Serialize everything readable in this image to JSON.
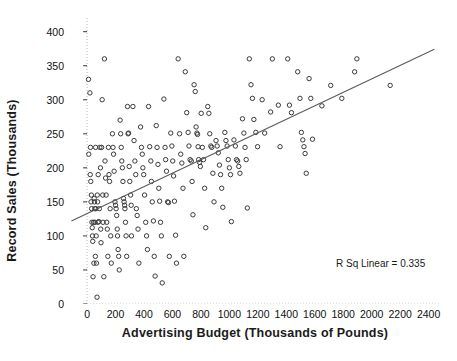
{
  "chart_data": {
    "type": "scatter",
    "title": "",
    "xlabel": "Advertising Budget (Thousands of Pounds)",
    "ylabel": "Record Sales (Thousands)",
    "xlim": [
      -120,
      2480
    ],
    "ylim": [
      0,
      420
    ],
    "xticks": [
      0,
      200,
      400,
      600,
      800,
      1000,
      1200,
      1400,
      1600,
      1800,
      2000,
      2200,
      2400
    ],
    "yticks": [
      0,
      50,
      100,
      150,
      200,
      250,
      300,
      350,
      400
    ],
    "xtick_labels": [
      "0",
      "200",
      "400",
      "600",
      "800",
      "1000",
      "1200",
      "1400",
      "1600",
      "1800",
      "2000",
      "2200",
      "2400"
    ],
    "ytick_labels": [
      "0",
      "50",
      "100",
      "150",
      "200",
      "250",
      "300",
      "350",
      "400"
    ],
    "grid": false,
    "legend": "none",
    "annotations": [
      {
        "text": "R Sq Linear = 0.335",
        "x": 2000,
        "y": 55
      }
    ],
    "marker": {
      "shape": "open-circle",
      "size": 4.4,
      "edge_color": "#3a3a3a",
      "face_color": "none"
    },
    "fit_line": {
      "type": "linear",
      "r_squared": 0.335,
      "color": "#5a5a5a",
      "x_start": -110,
      "y_start": 122,
      "x_end": 2440,
      "y_end": 374
    },
    "axis_line_color": "#b8b8b8",
    "axis_line_style": "dotted",
    "points": [
      [
        10,
        330
      ],
      [
        12,
        220
      ],
      [
        20,
        310
      ],
      [
        22,
        190
      ],
      [
        24,
        230
      ],
      [
        26,
        180
      ],
      [
        28,
        150
      ],
      [
        30,
        160
      ],
      [
        32,
        140
      ],
      [
        34,
        120
      ],
      [
        36,
        112
      ],
      [
        38,
        100
      ],
      [
        40,
        92
      ],
      [
        42,
        40
      ],
      [
        46,
        120
      ],
      [
        48,
        60
      ],
      [
        50,
        155
      ],
      [
        52,
        150
      ],
      [
        54,
        140
      ],
      [
        56,
        120
      ],
      [
        58,
        70
      ],
      [
        60,
        230
      ],
      [
        62,
        140
      ],
      [
        64,
        100
      ],
      [
        66,
        60
      ],
      [
        70,
        10
      ],
      [
        72,
        160
      ],
      [
        74,
        150
      ],
      [
        76,
        120
      ],
      [
        78,
        190
      ],
      [
        82,
        121
      ],
      [
        86,
        140
      ],
      [
        90,
        230
      ],
      [
        94,
        200
      ],
      [
        96,
        110
      ],
      [
        98,
        90
      ],
      [
        102,
        230
      ],
      [
        106,
        300
      ],
      [
        110,
        160
      ],
      [
        112,
        120
      ],
      [
        118,
        40
      ],
      [
        122,
        360
      ],
      [
        126,
        210
      ],
      [
        130,
        185
      ],
      [
        134,
        160
      ],
      [
        138,
        120
      ],
      [
        142,
        110
      ],
      [
        146,
        70
      ],
      [
        150,
        230
      ],
      [
        154,
        190
      ],
      [
        158,
        180
      ],
      [
        162,
        140
      ],
      [
        166,
        100
      ],
      [
        170,
        60
      ],
      [
        178,
        250
      ],
      [
        182,
        230
      ],
      [
        186,
        220
      ],
      [
        190,
        195
      ],
      [
        196,
        150
      ],
      [
        200,
        145
      ],
      [
        204,
        140
      ],
      [
        208,
        130
      ],
      [
        212,
        110
      ],
      [
        214,
        100
      ],
      [
        218,
        80
      ],
      [
        222,
        70
      ],
      [
        226,
        50
      ],
      [
        232,
        270
      ],
      [
        236,
        250
      ],
      [
        240,
        230
      ],
      [
        244,
        210
      ],
      [
        248,
        200
      ],
      [
        252,
        180
      ],
      [
        256,
        155
      ],
      [
        260,
        150
      ],
      [
        264,
        145
      ],
      [
        266,
        140
      ],
      [
        270,
        120
      ],
      [
        274,
        100
      ],
      [
        278,
        70
      ],
      [
        284,
        290
      ],
      [
        288,
        250
      ],
      [
        292,
        251
      ],
      [
        296,
        202
      ],
      [
        300,
        180
      ],
      [
        306,
        160
      ],
      [
        310,
        145
      ],
      [
        312,
        100
      ],
      [
        322,
        290
      ],
      [
        330,
        240
      ],
      [
        336,
        210
      ],
      [
        342,
        190
      ],
      [
        346,
        140
      ],
      [
        352,
        130
      ],
      [
        358,
        110
      ],
      [
        364,
        60
      ],
      [
        376,
        260
      ],
      [
        382,
        230
      ],
      [
        388,
        220
      ],
      [
        392,
        200
      ],
      [
        398,
        190
      ],
      [
        404,
        160
      ],
      [
        412,
        120
      ],
      [
        418,
        100
      ],
      [
        424,
        80
      ],
      [
        432,
        290
      ],
      [
        440,
        231
      ],
      [
        448,
        210
      ],
      [
        452,
        180
      ],
      [
        458,
        150
      ],
      [
        466,
        122
      ],
      [
        472,
        70
      ],
      [
        478,
        41
      ],
      [
        486,
        262
      ],
      [
        492,
        230
      ],
      [
        498,
        205
      ],
      [
        504,
        170
      ],
      [
        510,
        151
      ],
      [
        516,
        120
      ],
      [
        522,
        100
      ],
      [
        528,
        31
      ],
      [
        540,
        301
      ],
      [
        548,
        230
      ],
      [
        552,
        212
      ],
      [
        558,
        195
      ],
      [
        566,
        150
      ],
      [
        572,
        149
      ],
      [
        578,
        70
      ],
      [
        588,
        251
      ],
      [
        596,
        232
      ],
      [
        602,
        210
      ],
      [
        608,
        188
      ],
      [
        614,
        151
      ],
      [
        622,
        101
      ],
      [
        628,
        60
      ],
      [
        640,
        360
      ],
      [
        650,
        250
      ],
      [
        658,
        220
      ],
      [
        666,
        207
      ],
      [
        674,
        170
      ],
      [
        680,
        70
      ],
      [
        690,
        341
      ],
      [
        700,
        281
      ],
      [
        710,
        252
      ],
      [
        716,
        232
      ],
      [
        724,
        212
      ],
      [
        732,
        210
      ],
      [
        738,
        180
      ],
      [
        744,
        131
      ],
      [
        752,
        322
      ],
      [
        760,
        312
      ],
      [
        766,
        260
      ],
      [
        772,
        251
      ],
      [
        776,
        249
      ],
      [
        780,
        231
      ],
      [
        784,
        212
      ],
      [
        790,
        208
      ],
      [
        796,
        202
      ],
      [
        802,
        280
      ],
      [
        810,
        230
      ],
      [
        818,
        212
      ],
      [
        826,
        170
      ],
      [
        834,
        112
      ],
      [
        848,
        290
      ],
      [
        856,
        280
      ],
      [
        862,
        250
      ],
      [
        870,
        232
      ],
      [
        876,
        230
      ],
      [
        884,
        192
      ],
      [
        892,
        150
      ],
      [
        906,
        240
      ],
      [
        914,
        232
      ],
      [
        922,
        222
      ],
      [
        930,
        204
      ],
      [
        938,
        190
      ],
      [
        946,
        170
      ],
      [
        954,
        142
      ],
      [
        968,
        252
      ],
      [
        976,
        240
      ],
      [
        984,
        232
      ],
      [
        992,
        212
      ],
      [
        1000,
        200
      ],
      [
        1008,
        190
      ],
      [
        1014,
        121
      ],
      [
        1032,
        241
      ],
      [
        1042,
        232
      ],
      [
        1050,
        212
      ],
      [
        1058,
        210
      ],
      [
        1066,
        202
      ],
      [
        1074,
        192
      ],
      [
        1092,
        272
      ],
      [
        1102,
        251
      ],
      [
        1110,
        230
      ],
      [
        1118,
        212
      ],
      [
        1126,
        141
      ],
      [
        1140,
        360
      ],
      [
        1152,
        322
      ],
      [
        1162,
        302
      ],
      [
        1172,
        271
      ],
      [
        1186,
        252
      ],
      [
        1198,
        231
      ],
      [
        1230,
        300
      ],
      [
        1248,
        251
      ],
      [
        1290,
        282
      ],
      [
        1302,
        360
      ],
      [
        1344,
        292
      ],
      [
        1356,
        231
      ],
      [
        1410,
        360
      ],
      [
        1422,
        292
      ],
      [
        1436,
        281
      ],
      [
        1480,
        341
      ],
      [
        1496,
        302
      ],
      [
        1506,
        252
      ],
      [
        1516,
        241
      ],
      [
        1524,
        231
      ],
      [
        1532,
        221
      ],
      [
        1540,
        192
      ],
      [
        1560,
        331
      ],
      [
        1572,
        302
      ],
      [
        1584,
        242
      ],
      [
        1650,
        291
      ],
      [
        1712,
        321
      ],
      [
        1790,
        302
      ],
      [
        1880,
        341
      ],
      [
        1896,
        360
      ],
      [
        2130,
        321
      ]
    ]
  }
}
